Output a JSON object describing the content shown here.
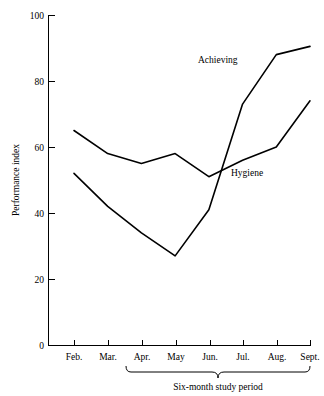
{
  "chart_data": {
    "type": "line",
    "title": "",
    "xlabel": "Six-month study period",
    "ylabel": "Performance index",
    "categories": [
      "Feb.",
      "Mar.",
      "Apr.",
      "May",
      "Jun.",
      "Jul.",
      "Aug.",
      "Sept."
    ],
    "ylim": [
      0,
      100
    ],
    "yticks": [
      0,
      20,
      40,
      60,
      80,
      100
    ],
    "ytick_labels": [
      "0",
      "20",
      "40",
      "60",
      "80",
      "100"
    ],
    "grid": false,
    "legend_position": "inline-annotation",
    "series": [
      {
        "name": "Achieving",
        "values": [
          52,
          42,
          34,
          27,
          41,
          73,
          88,
          90.5
        ],
        "color": "#000000"
      },
      {
        "name": "Hygiene",
        "values": [
          65,
          58,
          55,
          58,
          51,
          56,
          60,
          74
        ],
        "color": "#000000"
      }
    ],
    "annotations": [
      {
        "text": "Achieving",
        "series": "Achieving"
      },
      {
        "text": "Hygiene",
        "series": "Hygiene"
      }
    ],
    "bracket": {
      "label": "Six-month study period",
      "from_category": "Apr.",
      "to_category": "Sept."
    }
  },
  "axes": {
    "y_title": "Performance index",
    "y_tick_0": "0",
    "y_tick_20": "20",
    "y_tick_40": "40",
    "y_tick_60": "60",
    "y_tick_80": "80",
    "y_tick_100": "100",
    "x_tick_feb": "Feb.",
    "x_tick_mar": "Mar.",
    "x_tick_apr": "Apr.",
    "x_tick_may": "May",
    "x_tick_jun": "Jun.",
    "x_tick_jul": "Jul.",
    "x_tick_aug": "Aug.",
    "x_tick_sept": "Sept."
  },
  "labels": {
    "achieving": "Achieving",
    "hygiene": "Hygiene",
    "study_period": "Six-month study period"
  }
}
